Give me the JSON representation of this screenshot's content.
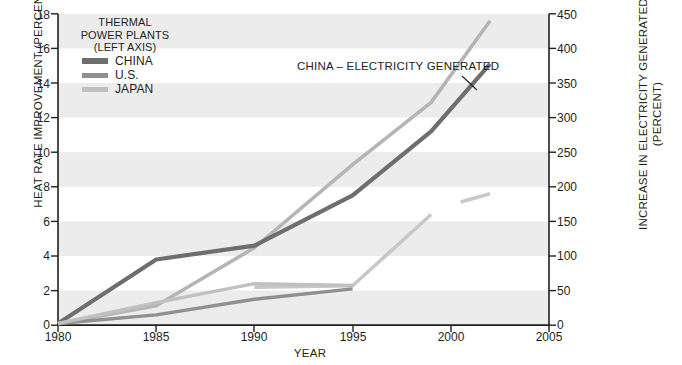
{
  "chart_data": {
    "type": "line",
    "title": "",
    "xlabel": "YEAR",
    "ylabel": "HEAT RATE IMPROVEMENT (PERCENT)",
    "ylabel_right": "INCREASE IN ELECTRICITY GENERATED (PERCENT)",
    "ylabel_right_line1": "INCREASE IN ELECTRICITY GENERATED",
    "ylabel_right_line2": "(PERCENT)",
    "xlim": [
      1980,
      2005
    ],
    "ylim": [
      0,
      18
    ],
    "ylim_right": [
      0,
      450
    ],
    "xticks": [
      1980,
      1985,
      1990,
      1995,
      2000,
      2005
    ],
    "yticks_left": [
      0,
      2,
      4,
      6,
      8,
      10,
      12,
      14,
      16,
      18
    ],
    "yticks_right": [
      0,
      50,
      100,
      150,
      200,
      250,
      300,
      350,
      400,
      450
    ],
    "grid": false,
    "band_shading": true,
    "legend_position": "top-left",
    "series": [
      {
        "name": "CHINA",
        "axis": "left",
        "color": "#6e6e6e",
        "x": [
          1980,
          1985,
          1990,
          1995,
          1999,
          2002
        ],
        "values": [
          0.1,
          3.8,
          4.6,
          7.5,
          11.2,
          15.1
        ]
      },
      {
        "name": "U.S.",
        "axis": "left",
        "color": "#909090",
        "x": [
          1980,
          1985,
          1990,
          1995
        ],
        "values": [
          0.1,
          0.6,
          1.5,
          2.1
        ]
      },
      {
        "name": "JAPAN",
        "axis": "left",
        "color": "#c0c0c0",
        "x": [
          1980,
          1985,
          1990,
          1995
        ],
        "values": [
          0.1,
          1.3,
          2.4,
          2.3
        ]
      },
      {
        "name": "CHINA - ELECTRICITY GENERATED",
        "axis": "right",
        "color": "#b5b5b5",
        "x": [
          1980,
          1985,
          1990,
          1995,
          1999,
          2002
        ],
        "values": [
          2,
          28,
          112,
          232,
          322,
          440
        ]
      },
      {
        "name": "JAPAN - ELECTRICITY GENERATED",
        "axis": "right",
        "color": "#c8c8c8",
        "x": [
          1990,
          1995,
          1999
        ],
        "values": [
          55,
          57,
          160
        ]
      },
      {
        "name": "U.S. - ELECTRICITY GENERATED",
        "axis": "right",
        "color": "#c8c8c8",
        "x": [
          2000.5,
          2002
        ],
        "values": [
          178,
          190
        ]
      }
    ],
    "annotations": [
      {
        "text": "CHINA – ELECTRICITY GENERATED",
        "x": 1998.2,
        "y_right": 380,
        "points_to_series": "CHINA - ELECTRICITY GENERATED"
      }
    ]
  },
  "legend": {
    "title_line1": "THERMAL",
    "title_line2": "POWER PLANTS",
    "title_line3": "(LEFT AXIS)",
    "items": [
      {
        "label": "CHINA",
        "color": "#6e6e6e"
      },
      {
        "label": "U.S.",
        "color": "#909090"
      },
      {
        "label": "JAPAN",
        "color": "#c0c0c0"
      }
    ]
  },
  "axes": {
    "x_tick_labels": [
      "1980",
      "1985",
      "1990",
      "1995",
      "2000",
      "2005"
    ],
    "y_left_tick_labels": [
      "0",
      "2",
      "4",
      "6",
      "8",
      "10",
      "12",
      "14",
      "16",
      "18"
    ],
    "y_right_tick_labels": [
      "0",
      "50",
      "100",
      "150",
      "200",
      "250",
      "300",
      "350",
      "400",
      "450"
    ]
  }
}
